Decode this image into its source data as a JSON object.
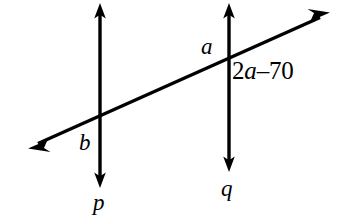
{
  "figure": {
    "type": "geometry-diagram",
    "background_color": "#ffffff",
    "stroke_color": "#000000",
    "stroke_width": 3
  },
  "lines": {
    "p": {
      "name": "p",
      "label": "p",
      "orientation": "vertical",
      "x": 100,
      "y_top": 3,
      "y_bottom": 188,
      "arrow_top": true,
      "arrow_bottom": true,
      "label_x": 101,
      "label_y": 203
    },
    "q": {
      "name": "q",
      "label": "q",
      "orientation": "vertical",
      "x": 229,
      "y_top": 3,
      "y_bottom": 172,
      "arrow_top": true,
      "arrow_bottom": true,
      "label_x": 229,
      "label_y": 189
    },
    "transversal": {
      "name": "transversal",
      "label": "",
      "orientation": "oblique",
      "x1": 28,
      "y1": 148,
      "x2": 330,
      "y2": 13,
      "arrow_start": true,
      "arrow_end": true
    }
  },
  "intersections": [
    {
      "name": "p-transversal",
      "x": 100,
      "y": 116
    },
    {
      "name": "q-transversal",
      "x": 229,
      "y": 58
    }
  ],
  "angle_labels": {
    "a": {
      "text": "a",
      "style": "italic",
      "x": 210,
      "y": 47,
      "at_intersection": "q-transversal",
      "position": "upper-left"
    },
    "b": {
      "text": "b",
      "style": "italic",
      "x": 86,
      "y": 143,
      "at_intersection": "p-transversal",
      "position": "lower-left"
    },
    "expression": {
      "text": "2a–70",
      "prefix": "2",
      "variable": "a",
      "suffix": "–70",
      "x": 234,
      "y": 71,
      "at_intersection": "q-transversal",
      "position": "lower-right"
    }
  },
  "line_labels": {
    "p": "p",
    "q": "q"
  }
}
